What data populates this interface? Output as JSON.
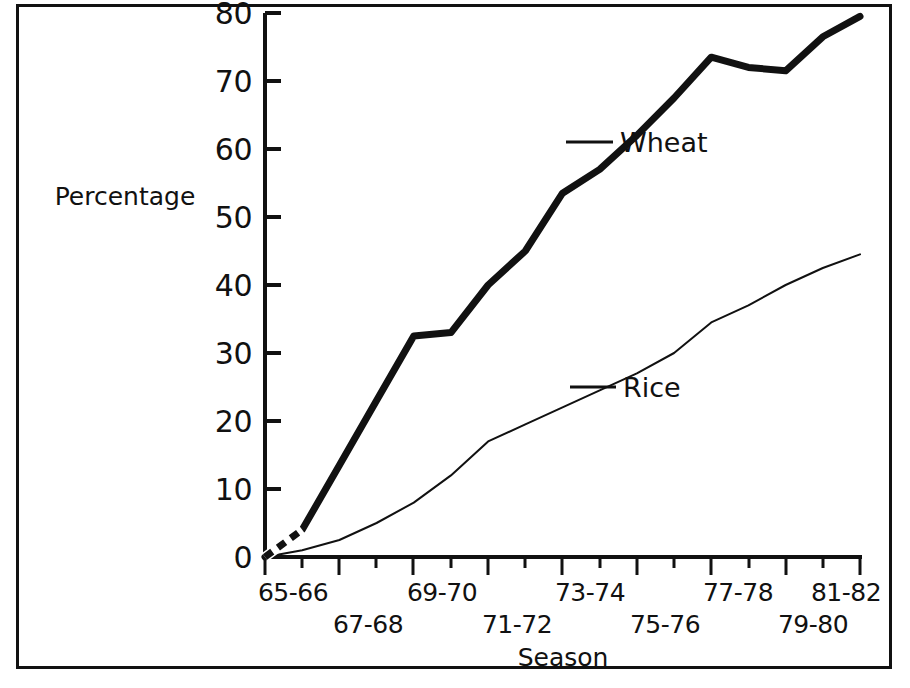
{
  "chart_data": {
    "type": "line",
    "title": "",
    "xlabel": "Season",
    "ylabel": "Percentage",
    "ylim": [
      0,
      80
    ],
    "yticks": [
      0,
      10,
      20,
      30,
      40,
      50,
      60,
      70,
      80
    ],
    "ytick_labels": [
      "0",
      "10",
      "20",
      "30",
      "40",
      "50",
      "60",
      "70",
      "80"
    ],
    "categories": [
      "65-66",
      "66-67",
      "67-68",
      "68-69",
      "69-70",
      "70-71",
      "71-72",
      "72-73",
      "73-74",
      "74-75",
      "75-76",
      "76-77",
      "77-78",
      "78-79",
      "79-80",
      "80-81",
      "81-82"
    ],
    "xtick_labels_shown": [
      "65-66",
      "67-68",
      "69-70",
      "71-72",
      "73-74",
      "75-76",
      "77-78",
      "79-80",
      "81-82"
    ],
    "xtick_rows": {
      "upper": [
        "65-66",
        "69-70",
        "73-74",
        "77-78",
        "81-82"
      ],
      "lower": [
        "67-68",
        "71-72",
        "75-76",
        "79-80"
      ]
    },
    "grid": false,
    "legend_position": "inline-labels",
    "series": [
      {
        "name": "Wheat",
        "label": "Wheat",
        "color": "#111111",
        "linewidth": 7,
        "values": [
          0,
          4,
          13.5,
          23,
          32.5,
          33,
          40,
          45,
          53.5,
          57,
          62,
          67.5,
          73.5,
          72,
          71.5,
          76.5,
          79.5
        ]
      },
      {
        "name": "Rice",
        "label": "Rice",
        "color": "#111111",
        "linewidth": 2,
        "values": [
          0,
          1,
          2.5,
          5,
          8,
          12,
          17,
          19.5,
          22,
          24.5,
          27,
          30,
          34.5,
          37,
          40,
          42.5,
          44.5
        ]
      }
    ],
    "annotations": [
      {
        "text": "Wheat",
        "anchor_series": "Wheat",
        "anchor_index": 10
      },
      {
        "text": "Rice",
        "anchor_series": "Rice",
        "anchor_index": 10
      }
    ]
  },
  "axis": {
    "y_title": "Percentage",
    "x_title": "Season"
  },
  "ytick_labels": {
    "t0": "0",
    "t10": "10",
    "t20": "20",
    "t30": "30",
    "t40": "40",
    "t50": "50",
    "t60": "60",
    "t70": "70",
    "t80": "80"
  },
  "xtick_labels": {
    "u0": "65-66",
    "u1": "69-70",
    "u2": "73-74",
    "u3": "77-78",
    "u4": "81-82",
    "l0": "67-68",
    "l1": "71-72",
    "l2": "75-76",
    "l3": "79-80"
  },
  "series_labels": {
    "wheat": "Wheat",
    "rice": "Rice"
  },
  "colors": {
    "ink": "#111111",
    "background": "#ffffff"
  }
}
